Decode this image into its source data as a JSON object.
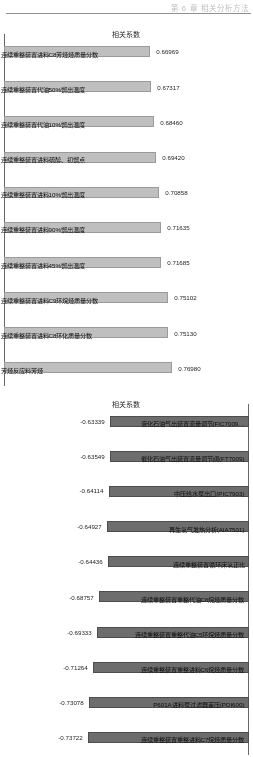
{
  "page": {
    "running_head": "第 6 章   相关分析方法",
    "orientation_note": "figure printed sideways"
  },
  "chart_data": [
    {
      "id": "positive-correlation-chart",
      "type": "bar",
      "title": "",
      "xlabel": "",
      "ylabel": "相关系数",
      "ylim": [
        0,
        0.8
      ],
      "grid": false,
      "legend": "none",
      "orientation": "vertical",
      "categories": [
        "连续重整装置进料C8芳烃烃质量分数",
        "连续重整装置代油50%馏出温度",
        "连续重整装置代油10%馏出温度",
        "连续重整装置进料硫醇、初馏点",
        "连续重整装置进料10%馏出温度",
        "连续重整装置进料90%馏出温度",
        "连续重整装置进料45%馏出温度",
        "连续重整装置进料C9环烷烃质量分数",
        "连续重整装置进料C8环化质量分数",
        "芳烃反应料芳烃"
      ],
      "values": [
        0.66969,
        0.67317,
        0.6846,
        0.6942,
        0.70858,
        0.71635,
        0.71685,
        0.75102,
        0.7513,
        0.7698
      ],
      "value_labels": [
        "0.66969",
        "0.67317",
        "0.68460",
        "0.69420",
        "0.70858",
        "0.71635",
        "0.71685",
        "0.75102",
        "0.75130",
        "0.76980"
      ]
    },
    {
      "id": "negative-correlation-chart",
      "type": "bar",
      "title": "",
      "xlabel": "",
      "ylabel": "相关系数",
      "ylim": [
        -0.8,
        0
      ],
      "grid": false,
      "legend": "none",
      "orientation": "vertical",
      "categories": [
        "液化石油气出装置流量调节(FIC7009…",
        "催化石油气出装置流量调节阀(FT7009)",
        "中压给水泵出口(PIC7903)",
        "再生氢气发热分析(AIA7501)",
        "连续重整装置循环床氢正比",
        "连续重整装置重整代油C6烷烃质量分数",
        "连续重整装置重整代油C5环烷烃质量分数",
        "连续重整装置重整进料C6烷烃质量分数",
        "P601A进料泵过滤器差压(PDI600)",
        "连续重整装置重整进料C7烷烃质量分数"
      ],
      "values": [
        -0.63339,
        -0.63549,
        -0.64114,
        -0.64927,
        -0.64436,
        -0.68757,
        -0.69333,
        -0.71264,
        -0.73078,
        -0.73722
      ],
      "value_labels": [
        "-0.63339",
        "-0.63549",
        "-0.64114",
        "-0.64927",
        "-0.64436",
        "-0.68757",
        "-0.69333",
        "-0.71264",
        "-0.73078",
        "-0.73722"
      ]
    }
  ]
}
